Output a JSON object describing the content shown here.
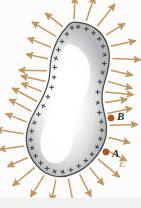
{
  "figure": {
    "kind": "physics-diagram",
    "background_color": "#fdfcfa",
    "width": 141,
    "height": 208
  },
  "conductor": {
    "name": "irregular-charged-conductor",
    "outline_color": "#4a4a4a",
    "fill_inner_color": "#ffffff",
    "fill_edge_color": "#b9bbbd",
    "shape_path": "M74,22 C91,22 104,32 108,47 C112,62 106,76 103,88 C100,100 104,110 106,122 C108,134 104,148 93,160 C82,172 66,179 54,176 C40,173 30,160 27,146 C24,131 31,118 38,106 C45,94 50,82 50,70 C50,54 57,38 66,28 C68,25 71,22 74,22 Z"
  },
  "charges": {
    "symbol": "+",
    "color": "#3a3a3a",
    "count": 40,
    "description": "positive surface charges distributed along conductor boundary"
  },
  "field": {
    "name": "electric-field",
    "label": "E",
    "arrow_color": "#c09a64",
    "arrow_outline_color": "#9a7a45",
    "arrow_count": 34,
    "direction": "outward-normal-to-surface"
  },
  "points": [
    {
      "label": "B",
      "dot_color": "#b4561d",
      "x": 111,
      "y": 118
    },
    {
      "label": "A",
      "dot_color": "#b4561d",
      "x": 106,
      "y": 152
    }
  ],
  "labels": {
    "point_b": "B",
    "point_a": "A",
    "field_e": "E"
  }
}
